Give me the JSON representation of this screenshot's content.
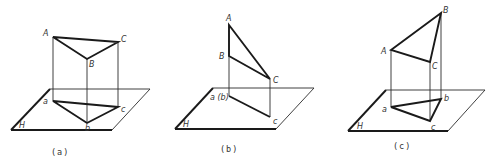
{
  "figure": {
    "stroke_color": "#1a1a1a",
    "background": "#ffffff"
  },
  "panels": [
    {
      "id": "a",
      "caption": "(a)",
      "plane_label": "H",
      "space_labels": {
        "A": "A",
        "B": "B",
        "C": "C"
      },
      "projection_labels": {
        "a": "a",
        "b": "b",
        "c": "c"
      }
    },
    {
      "id": "b",
      "caption": "(b)",
      "plane_label": "H",
      "space_labels": {
        "A": "A",
        "B": "B",
        "C": "C"
      },
      "projection_labels": {
        "ab": "a (b)",
        "c": "c"
      }
    },
    {
      "id": "c",
      "caption": "(c)",
      "plane_label": "H",
      "space_labels": {
        "A": "A",
        "B": "B",
        "C": "C"
      },
      "projection_labels": {
        "a": "a",
        "b": "b",
        "c": "c"
      }
    }
  ]
}
